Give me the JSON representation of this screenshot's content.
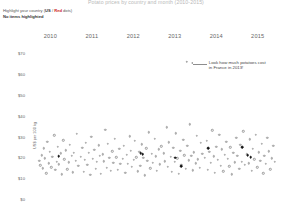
{
  "chart_title": "Potato prices by country and month (2010-2015)",
  "controls": {
    "highlight_prefix": "Highlight your country (",
    "highlight_option_a": "US",
    "highlight_sep": " / ",
    "highlight_option_b": "Red",
    "highlight_suffix": " dots)",
    "status": "No items highlighted"
  },
  "annotation": {
    "text": "Look how much potatoes cost\nin France in 2013!",
    "dot_label": "france-2013-point"
  },
  "chart_data": {
    "type": "scatter",
    "title": "Potato prices by country and month (2010-2015)",
    "xlabel": "",
    "ylabel": "US$ per 100 kg",
    "xlim": [
      2009.75,
      2015.85
    ],
    "ylim": [
      0,
      75
    ],
    "grid": false,
    "legend": null,
    "x_tick_labels": [
      "2010",
      "2011",
      "2012",
      "2013",
      "2014",
      "2015"
    ],
    "x_tick_values": [
      2010,
      2011,
      2012,
      2013,
      2014,
      2015
    ],
    "y_tick_labels": [
      "$70",
      "$60",
      "$50",
      "$40",
      "$30",
      "$20",
      "$10",
      "$0"
    ],
    "y_tick_values": [
      70,
      60,
      50,
      40,
      30,
      20,
      10,
      0
    ],
    "series": [
      {
        "name": "All countries",
        "color": "#9a9a9a",
        "marker": "open-circle",
        "points": [
          [
            2010.02,
            18.5
          ],
          [
            2010.05,
            16.2
          ],
          [
            2010.08,
            21.0
          ],
          [
            2010.1,
            14.8
          ],
          [
            2010.13,
            24.3
          ],
          [
            2010.16,
            19.6
          ],
          [
            2010.19,
            12.4
          ],
          [
            2010.22,
            27.5
          ],
          [
            2010.25,
            17.1
          ],
          [
            2010.28,
            22.8
          ],
          [
            2010.31,
            15.3
          ],
          [
            2010.34,
            20.2
          ],
          [
            2010.38,
            30.6
          ],
          [
            2010.41,
            13.9
          ],
          [
            2010.44,
            18.0
          ],
          [
            2010.47,
            25.1
          ],
          [
            2010.5,
            16.7
          ],
          [
            2010.54,
            21.9
          ],
          [
            2010.57,
            11.8
          ],
          [
            2010.6,
            28.3
          ],
          [
            2010.63,
            19.0
          ],
          [
            2010.66,
            23.4
          ],
          [
            2010.7,
            14.2
          ],
          [
            2010.73,
            17.6
          ],
          [
            2010.76,
            26.0
          ],
          [
            2010.8,
            20.7
          ],
          [
            2010.83,
            12.9
          ],
          [
            2010.86,
            22.1
          ],
          [
            2010.9,
            18.3
          ],
          [
            2010.93,
            31.2
          ],
          [
            2010.96,
            15.9
          ],
          [
            2011.02,
            20.4
          ],
          [
            2011.06,
            24.7
          ],
          [
            2011.09,
            13.1
          ],
          [
            2011.12,
            18.9
          ],
          [
            2011.15,
            27.0
          ],
          [
            2011.18,
            16.4
          ],
          [
            2011.22,
            22.3
          ],
          [
            2011.25,
            11.6
          ],
          [
            2011.28,
            29.8
          ],
          [
            2011.31,
            19.2
          ],
          [
            2011.35,
            23.6
          ],
          [
            2011.38,
            14.5
          ],
          [
            2011.41,
            17.8
          ],
          [
            2011.45,
            25.9
          ],
          [
            2011.48,
            20.9
          ],
          [
            2011.51,
            12.2
          ],
          [
            2011.55,
            21.5
          ],
          [
            2011.58,
            18.1
          ],
          [
            2011.61,
            33.4
          ],
          [
            2011.65,
            15.0
          ],
          [
            2011.68,
            26.6
          ],
          [
            2011.71,
            19.8
          ],
          [
            2011.75,
            13.7
          ],
          [
            2011.78,
            22.9
          ],
          [
            2011.81,
            17.3
          ],
          [
            2011.85,
            28.8
          ],
          [
            2011.88,
            20.1
          ],
          [
            2011.92,
            14.0
          ],
          [
            2011.95,
            24.0
          ],
          [
            2011.98,
            16.8
          ],
          [
            2012.03,
            19.4
          ],
          [
            2012.06,
            25.5
          ],
          [
            2012.1,
            12.7
          ],
          [
            2012.13,
            21.2
          ],
          [
            2012.16,
            17.0
          ],
          [
            2012.2,
            30.1
          ],
          [
            2012.23,
            23.1
          ],
          [
            2012.26,
            15.6
          ],
          [
            2012.3,
            18.7
          ],
          [
            2012.33,
            27.9
          ],
          [
            2012.36,
            20.0
          ],
          [
            2012.4,
            13.3
          ],
          [
            2012.43,
            22.6
          ],
          [
            2012.46,
            16.1
          ],
          [
            2012.5,
            26.3
          ],
          [
            2012.53,
            19.9
          ],
          [
            2012.56,
            11.4
          ],
          [
            2012.6,
            24.4
          ],
          [
            2012.63,
            18.4
          ],
          [
            2012.66,
            32.0
          ],
          [
            2012.7,
            14.7
          ],
          [
            2012.73,
            21.7
          ],
          [
            2012.76,
            17.5
          ],
          [
            2012.8,
            29.0
          ],
          [
            2012.83,
            20.6
          ],
          [
            2012.86,
            13.5
          ],
          [
            2012.9,
            23.9
          ],
          [
            2012.93,
            16.6
          ],
          [
            2012.96,
            25.4
          ],
          [
            2013.02,
            22.0
          ],
          [
            2013.05,
            18.2
          ],
          [
            2013.09,
            34.5
          ],
          [
            2013.12,
            15.4
          ],
          [
            2013.15,
            27.2
          ],
          [
            2013.19,
            20.3
          ],
          [
            2013.22,
            13.0
          ],
          [
            2013.25,
            24.6
          ],
          [
            2013.29,
            17.9
          ],
          [
            2013.32,
            31.5
          ],
          [
            2013.35,
            19.5
          ],
          [
            2013.39,
            12.1
          ],
          [
            2013.42,
            23.3
          ],
          [
            2013.45,
            16.3
          ],
          [
            2013.49,
            28.5
          ],
          [
            2013.52,
            21.1
          ],
          [
            2013.55,
            14.4
          ],
          [
            2013.59,
            25.7
          ],
          [
            2013.62,
            18.6
          ],
          [
            2013.65,
            36.0
          ],
          [
            2013.69,
            20.8
          ],
          [
            2013.72,
            13.8
          ],
          [
            2013.75,
            22.4
          ],
          [
            2013.79,
            17.2
          ],
          [
            2013.82,
            30.3
          ],
          [
            2013.85,
            19.1
          ],
          [
            2013.89,
            15.1
          ],
          [
            2013.92,
            26.9
          ],
          [
            2013.95,
            21.6
          ],
          [
            2014.02,
            19.7
          ],
          [
            2014.06,
            28.0
          ],
          [
            2014.09,
            14.1
          ],
          [
            2014.12,
            22.7
          ],
          [
            2014.16,
            17.4
          ],
          [
            2014.19,
            33.0
          ],
          [
            2014.23,
            20.5
          ],
          [
            2014.26,
            12.5
          ],
          [
            2014.29,
            25.2
          ],
          [
            2014.33,
            18.8
          ],
          [
            2014.36,
            30.8
          ],
          [
            2014.4,
            16.0
          ],
          [
            2014.43,
            23.8
          ],
          [
            2014.46,
            13.4
          ],
          [
            2014.5,
            21.3
          ],
          [
            2014.53,
            27.6
          ],
          [
            2014.57,
            19.3
          ],
          [
            2014.6,
            15.7
          ],
          [
            2014.63,
            24.9
          ],
          [
            2014.67,
            11.9
          ],
          [
            2014.7,
            22.2
          ],
          [
            2014.74,
            17.7
          ],
          [
            2014.77,
            29.5
          ],
          [
            2014.8,
            20.9
          ],
          [
            2014.84,
            14.6
          ],
          [
            2014.87,
            26.1
          ],
          [
            2014.91,
            18.0
          ],
          [
            2014.94,
            32.6
          ],
          [
            2014.97,
            16.5
          ],
          [
            2015.03,
            21.4
          ],
          [
            2015.07,
            17.1
          ],
          [
            2015.1,
            28.7
          ],
          [
            2015.14,
            13.6
          ],
          [
            2015.17,
            24.1
          ],
          [
            2015.21,
            19.0
          ],
          [
            2015.24,
            31.0
          ],
          [
            2015.28,
            15.2
          ],
          [
            2015.31,
            22.5
          ],
          [
            2015.35,
            18.3
          ],
          [
            2015.38,
            26.4
          ],
          [
            2015.42,
            12.3
          ],
          [
            2015.45,
            20.7
          ],
          [
            2015.49,
            16.9
          ],
          [
            2015.52,
            29.3
          ],
          [
            2015.56,
            23.0
          ],
          [
            2015.59,
            14.3
          ],
          [
            2015.63,
            19.6
          ],
          [
            2015.66,
            25.6
          ],
          [
            2015.7,
            17.8
          ]
        ]
      },
      {
        "name": "Highlighted",
        "color": "#111111",
        "marker": "filled-circle",
        "points": [
          [
            2010.49,
            20.5
          ],
          [
            2012.47,
            22.0
          ],
          [
            2012.52,
            21.4
          ],
          [
            2013.3,
            19.8
          ],
          [
            2013.44,
            15.9
          ],
          [
            2014.1,
            24.4
          ],
          [
            2014.92,
            24.8
          ],
          [
            2015.05,
            21.0
          ],
          [
            2015.12,
            20.2
          ]
        ]
      }
    ],
    "annotations": [
      {
        "text": "Look how much potatoes cost in France in 2013!",
        "target_x": 2013.58,
        "target_y": 66.0
      }
    ]
  }
}
